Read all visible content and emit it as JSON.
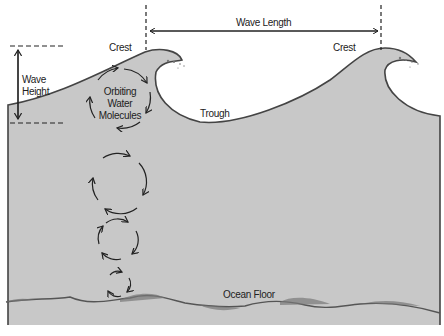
{
  "diagram": {
    "labels": {
      "crest_left": "Crest",
      "crest_right": "Crest",
      "wave_length": "Wave Length",
      "wave_height_line1": "Wave",
      "wave_height_line2": "Height",
      "trough": "Trough",
      "orbiting_line1": "Orbiting",
      "orbiting_line2": "Water",
      "orbiting_line3": "Molecules",
      "ocean_floor": "Ocean Floor"
    },
    "colors": {
      "water": "#c8c8c8",
      "outline": "#333333",
      "background": "#ffffff",
      "floor": "#555555"
    },
    "orbits": [
      {
        "cx": 120,
        "cy": 98,
        "r": 30
      },
      {
        "cx": 118,
        "cy": 189,
        "r": 27
      },
      {
        "cx": 118,
        "cy": 240,
        "r": 19
      },
      {
        "cx": 118,
        "cy": 284,
        "r": 11
      }
    ]
  }
}
